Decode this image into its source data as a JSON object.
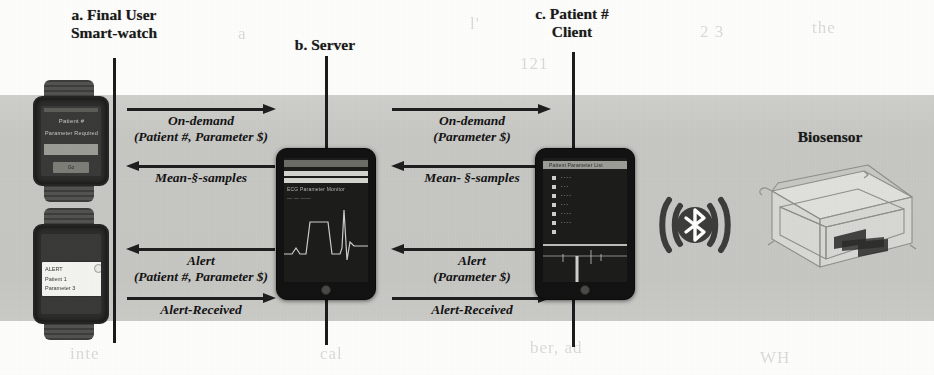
{
  "figure": {
    "type": "sequence-communication-diagram",
    "background_band_color": "#c9c9c6",
    "ink_color": "#1c1c1c"
  },
  "columns": [
    {
      "id": "smartwatch",
      "title_line1": "a. Final User",
      "title_line2": "Smart-watch"
    },
    {
      "id": "server",
      "title_line1": "b. Server",
      "title_line2": ""
    },
    {
      "id": "client",
      "title_line1": "c. Patient #",
      "title_line2": "Client"
    }
  ],
  "biosensor": {
    "label": "Biosensor"
  },
  "bluetooth": {
    "label": "bluetooth-wireless-icon"
  },
  "messages": [
    {
      "id": "on-demand-left",
      "direction": "right",
      "line1": "On-demand",
      "line2": "(Patient #, Parameter $)"
    },
    {
      "id": "mean-samples-left",
      "direction": "left",
      "line1": "Mean-§-samples",
      "line2": ""
    },
    {
      "id": "on-demand-right",
      "direction": "right",
      "line1": "On-demand",
      "line2": "(Parameter $)"
    },
    {
      "id": "mean-samples-right",
      "direction": "left",
      "line1": "Mean- §-samples",
      "line2": ""
    },
    {
      "id": "alert-left",
      "direction": "left",
      "line1": "Alert",
      "line2": "(Patient #, Parameter $)"
    },
    {
      "id": "alert-received-left",
      "direction": "right",
      "line1": "Alert-Received",
      "line2": ""
    },
    {
      "id": "alert-right",
      "direction": "left",
      "line1": "Alert",
      "line2": "(Parameter $)"
    },
    {
      "id": "alert-received-right",
      "direction": "right",
      "line1": "Alert-Received",
      "line2": ""
    }
  ],
  "devices": {
    "watch_request": {
      "name": "smart-watch-request-screen",
      "screen_line1": "Patient #",
      "screen_line2": "Parameter Required",
      "button_label": "Go"
    },
    "watch_alert": {
      "name": "smart-watch-alert-screen",
      "notif_line1": "ALERT",
      "notif_line2": "Patient 1",
      "notif_line3": "Parameter 3"
    },
    "server_tablet": {
      "name": "server-tablet",
      "screen_caption": "ECG Parameter Monitor"
    },
    "client_tablet": {
      "name": "client-tablet",
      "screen_caption": "Patient Parameter List"
    }
  },
  "scan_artifacts": [
    {
      "text": "l'",
      "x": 470,
      "y": 14
    },
    {
      "text": "2 3",
      "x": 700,
      "y": 22
    },
    {
      "text": "the",
      "x": 812,
      "y": 18
    },
    {
      "text": "121",
      "x": 520,
      "y": 54
    },
    {
      "text": "a",
      "x": 238,
      "y": 24
    },
    {
      "text": "hap",
      "x": 480,
      "y": 92
    },
    {
      "text": "two p",
      "x": 660,
      "y": 110
    },
    {
      "text": "nt",
      "x": 170,
      "y": 192
    },
    {
      "text": "ve p",
      "x": 690,
      "y": 196
    },
    {
      "text": "Re",
      "x": 700,
      "y": 218
    },
    {
      "text": "and",
      "x": 120,
      "y": 196
    },
    {
      "text": "ber, ad",
      "x": 530,
      "y": 338
    },
    {
      "text": "inte",
      "x": 70,
      "y": 344
    },
    {
      "text": "cal",
      "x": 320,
      "y": 344
    },
    {
      "text": "s",
      "x": 840,
      "y": 300
    },
    {
      "text": "WH",
      "x": 760,
      "y": 348
    }
  ]
}
